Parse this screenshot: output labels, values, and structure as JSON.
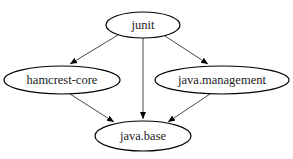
{
  "diagram": {
    "type": "dependency-graph",
    "caption_partial": "",
    "nodes": [
      {
        "id": "junit",
        "label": "junit",
        "cx": 143,
        "cy": 25,
        "rx": 37,
        "ry": 13
      },
      {
        "id": "hamcrest-core",
        "label": "hamcrest-core",
        "cx": 62,
        "cy": 80,
        "rx": 58,
        "ry": 14
      },
      {
        "id": "java.management",
        "label": "java.management",
        "cx": 222,
        "cy": 80,
        "rx": 67,
        "ry": 14
      },
      {
        "id": "java.base",
        "label": "java.base",
        "cx": 143,
        "cy": 136,
        "rx": 48,
        "ry": 15
      }
    ],
    "edges": [
      {
        "from": "junit",
        "to": "hamcrest-core"
      },
      {
        "from": "junit",
        "to": "java.base"
      },
      {
        "from": "junit",
        "to": "java.management"
      },
      {
        "from": "hamcrest-core",
        "to": "java.base"
      },
      {
        "from": "java.management",
        "to": "java.base"
      }
    ],
    "colors": {
      "stroke": "#000000",
      "text": "#222222",
      "background": "#ffffff"
    }
  }
}
